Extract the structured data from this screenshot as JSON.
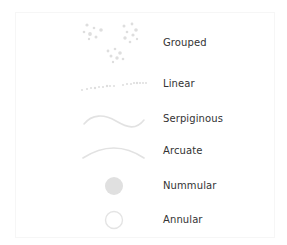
{
  "diagram": {
    "title": "",
    "colors": {
      "icon_fill": "#dedede",
      "icon_stroke": "#e2e2e2",
      "label": "#333333",
      "background": "#ffffff"
    },
    "items": [
      {
        "label": "Grouped",
        "icon": "grouped-dots-icon"
      },
      {
        "label": "Linear",
        "icon": "linear-dots-icon"
      },
      {
        "label": "Serpiginous",
        "icon": "serpiginous-wave-icon"
      },
      {
        "label": "Arcuate",
        "icon": "arcuate-arc-icon"
      },
      {
        "label": "Nummular",
        "icon": "filled-circle-icon"
      },
      {
        "label": "Annular",
        "icon": "ring-icon"
      }
    ]
  }
}
